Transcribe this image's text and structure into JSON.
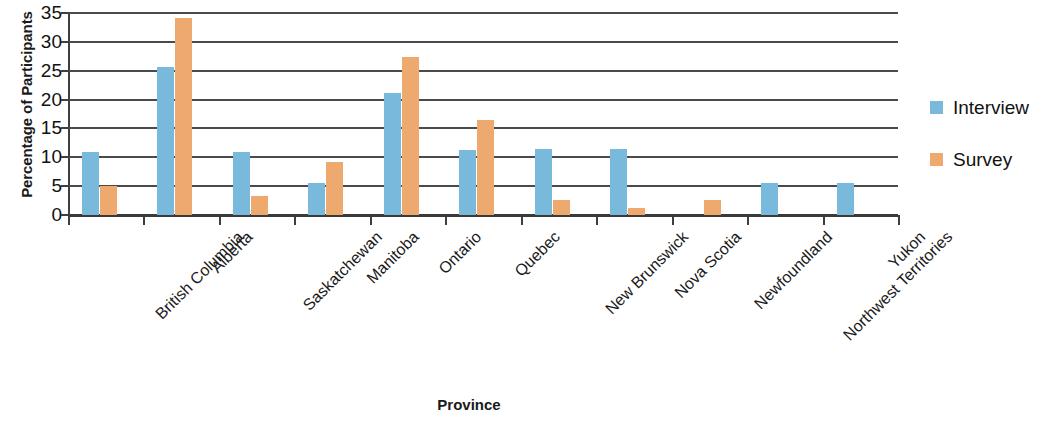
{
  "chart_data": {
    "type": "bar",
    "title": "",
    "xlabel": "Province",
    "ylabel": "Percentage of Participants",
    "ylim": [
      0,
      35
    ],
    "yticks": [
      0,
      5,
      10,
      15,
      20,
      25,
      30,
      35
    ],
    "ytick_labels": [
      "0",
      "5",
      "10",
      "15",
      "20",
      "25",
      "30",
      "35"
    ],
    "grid": "horizontal",
    "legend_position": "right",
    "categories": [
      "British Columbia",
      "Alberta",
      "Saskatchewan",
      "Manitoba",
      "Ontario",
      "Quebec",
      "New Brunswick",
      "Nova Scotia",
      "Newfoundland",
      "Northwest Territories",
      "Yukon"
    ],
    "series": [
      {
        "name": "Interview",
        "color": "#79b9dc",
        "values": [
          11.0,
          25.7,
          11.0,
          5.5,
          21.2,
          11.3,
          11.5,
          11.4,
          0,
          5.5,
          5.5
        ]
      },
      {
        "name": "Survey",
        "color": "#eda96e",
        "values": [
          5.0,
          34.2,
          3.3,
          9.2,
          27.3,
          16.4,
          2.6,
          1.2,
          2.6,
          0,
          0
        ]
      }
    ]
  },
  "legend": {
    "entries": [
      {
        "label": "Interview",
        "color": "#79b9dc"
      },
      {
        "label": "Survey",
        "color": "#eda96e"
      }
    ]
  },
  "axes": {
    "y_title": "Percentage of Participants",
    "x_title": "Province"
  }
}
